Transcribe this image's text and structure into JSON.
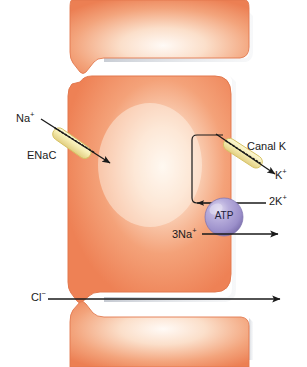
{
  "figure": {
    "type": "cell-transport-diagram"
  },
  "labels": {
    "na_apical": "Na",
    "na_apical_charge": "+",
    "enac": "ENaC",
    "canal_k": "Canal K",
    "k_out": "K",
    "k_out_charge": "+",
    "two_k": "2K",
    "two_k_charge": "+",
    "three_na": "3Na",
    "three_na_charge": "+",
    "chloride": "Cl",
    "chloride_charge": "−",
    "atp": "ATP"
  },
  "colors": {
    "cell_edge": "#ef8257",
    "cell_mid": "#f4a07b",
    "cell_light": "#fdf0e4",
    "cell_highlight": "#ffffff",
    "cell_outline": "#e2764c",
    "shadow": "#b9bfc9",
    "channel_fill": "#f6eeb4",
    "channel_edge": "#d8c667",
    "atp_fill": "#a79ccf",
    "atp_highlight": "#d6d0ea",
    "atp_edge": "#7b70ad",
    "arrow": "#1a1a1a",
    "background": "#ffffff"
  },
  "structures": [
    {
      "name": "top-neighbor-cell",
      "description": "upper adjacent epithelial cell"
    },
    {
      "name": "main-cell",
      "description": "central epithelial cell body"
    },
    {
      "name": "bottom-neighbor-cell",
      "description": "lower adjacent epithelial cell"
    },
    {
      "name": "enac-channel",
      "description": "apical sodium channel capsule"
    },
    {
      "name": "potassium-channel",
      "description": "basolateral potassium channel capsule"
    },
    {
      "name": "atp-pump",
      "description": "Na+/K+ ATPase pump sphere"
    }
  ],
  "arrows": [
    {
      "name": "na-influx-arrow",
      "from": "Na+ extracellular",
      "to": "cell interior",
      "through": "ENaC"
    },
    {
      "name": "k-efflux-arrow",
      "from": "cell interior",
      "to": "K+ extracellular",
      "through": "Canal K"
    },
    {
      "name": "two-k-influx-arrow",
      "from": "2K+ extracellular",
      "to": "cell interior",
      "through": "ATPase"
    },
    {
      "name": "three-na-efflux-arrow",
      "from": "3Na+ cell interior",
      "to": "extracellular",
      "through": "ATPase"
    },
    {
      "name": "k-recycling-loop",
      "description": "intracellular K+ recycling path from pump to channel"
    },
    {
      "name": "cl-paracellular-arrow",
      "from": "Cl- left",
      "to": "right",
      "through": "tight junction"
    }
  ]
}
